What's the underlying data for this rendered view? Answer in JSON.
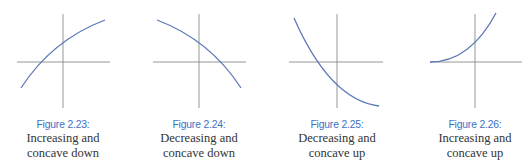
{
  "figures": [
    {
      "label": "Figure 2.23:",
      "line1": "Increasing and",
      "line2": "concave down",
      "axes": {
        "vx": 63,
        "vy1": 14,
        "vy2": 108,
        "hy": 62,
        "hx1": 17,
        "hx2": 110
      },
      "curve": "M21,88 Q52,40 105,20"
    },
    {
      "label": "Figure 2.24:",
      "line1": "Decreasing and",
      "line2": "concave down",
      "axes": {
        "vx": 199,
        "vy1": 14,
        "vy2": 108,
        "hy": 62,
        "hx1": 153,
        "hx2": 246
      },
      "curve": "M157,20 Q210,40 241,88"
    },
    {
      "label": "Figure 2.25:",
      "line1": "Decreasing and",
      "line2": "concave up",
      "axes": {
        "vx": 337,
        "vy1": 14,
        "vy2": 108,
        "hy": 62,
        "hx1": 289,
        "hx2": 383
      },
      "curve": "M294,18 Q330,100 379,106"
    },
    {
      "label": "Figure 2.26:",
      "line1": "Increasing and",
      "line2": "concave up",
      "axes": {
        "vx": 475,
        "vy1": 14,
        "vy2": 108,
        "hy": 62,
        "hx1": 430,
        "hx2": 522
      },
      "curve": "M430,62 Q470,62 496,13"
    }
  ],
  "colors": {
    "curve": "#5b78b8",
    "axis": "#8a8a8a",
    "label": "#3b70c6",
    "text": "#333333"
  }
}
